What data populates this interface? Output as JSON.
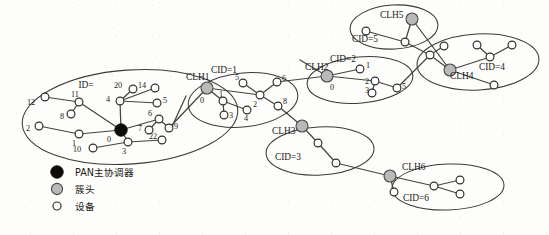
{
  "figure": {
    "type": "network-topology-diagram",
    "background_color": "#fdfdfb",
    "ink_color": "#1b1a18"
  },
  "legend": {
    "items": [
      {
        "marker": "pan-coordinator-marker",
        "label": "PAN主协调器",
        "fill": "#0c0b0a"
      },
      {
        "marker": "cluster-head-marker",
        "label": "簇头",
        "fill": "#b9b9b9"
      },
      {
        "marker": "device-marker",
        "label": "设备",
        "fill": "#ffffff"
      }
    ]
  },
  "clusters": [
    {
      "id": "pan",
      "name": "pan-cluster",
      "cid_label": "",
      "head_label": "",
      "extra_label": "ID=",
      "ellipse": {
        "cx": 130,
        "cy": 117,
        "rx": 108,
        "ry": 47,
        "rot": -4
      },
      "nodes": [
        {
          "id": "0",
          "type": "pan",
          "x": 121,
          "y": 130,
          "r": 6.2,
          "label": "0",
          "lx": 107,
          "ly": 142
        },
        {
          "id": "11",
          "type": "device",
          "x": 79,
          "y": 102,
          "r": 3.9,
          "label": "11",
          "lx": 71,
          "ly": 97
        },
        {
          "id": "12",
          "type": "device",
          "x": 45,
          "y": 97,
          "r": 3.9,
          "label": "12",
          "lx": 27,
          "ly": 105
        },
        {
          "id": "8",
          "type": "device",
          "x": 71,
          "y": 114,
          "r": 3.9,
          "label": "8",
          "lx": 60,
          "ly": 119
        },
        {
          "id": "2",
          "type": "device",
          "x": 39,
          "y": 126,
          "r": 3.9,
          "label": "2",
          "lx": 26,
          "ly": 131
        },
        {
          "id": "1",
          "type": "device",
          "x": 79,
          "y": 134,
          "r": 3.9,
          "label": "1",
          "lx": 72,
          "ly": 146
        },
        {
          "id": "10",
          "type": "device",
          "x": 93,
          "y": 148,
          "r": 3.9,
          "label": "10",
          "lx": 73,
          "ly": 152
        },
        {
          "id": "3",
          "type": "device",
          "x": 128,
          "y": 142,
          "r": 3.9,
          "label": "3",
          "lx": 122,
          "ly": 154
        },
        {
          "id": "4",
          "type": "device",
          "x": 120,
          "y": 101,
          "r": 3.9,
          "label": "4",
          "lx": 106,
          "ly": 102
        },
        {
          "id": "20",
          "type": "device",
          "x": 133,
          "y": 89,
          "r": 3.9,
          "label": "20",
          "lx": 114,
          "ly": 88
        },
        {
          "id": "14",
          "type": "device",
          "x": 155,
          "y": 88,
          "r": 3.9,
          "label": "14",
          "lx": 138,
          "ly": 88
        },
        {
          "id": "5",
          "type": "device",
          "x": 157,
          "y": 103,
          "r": 3.9,
          "label": "5",
          "lx": 163,
          "ly": 103
        },
        {
          "id": "6",
          "type": "device",
          "x": 159,
          "y": 119,
          "r": 3.9,
          "label": "6",
          "lx": 148,
          "ly": 116
        },
        {
          "id": "7",
          "type": "device",
          "x": 149,
          "y": 130,
          "r": 3.9,
          "label": "7",
          "lx": 138,
          "ly": 131
        },
        {
          "id": "9",
          "type": "device",
          "x": 169,
          "y": 128,
          "r": 3.9,
          "label": "9",
          "lx": 174,
          "ly": 129
        },
        {
          "id": "22",
          "type": "device",
          "x": 162,
          "y": 140,
          "r": 3.9,
          "label": "22",
          "lx": 149,
          "ly": 139
        }
      ],
      "links": [
        [
          "0",
          "11"
        ],
        [
          "11",
          "12"
        ],
        [
          "11",
          "8"
        ],
        [
          "0",
          "1"
        ],
        [
          "1",
          "2"
        ],
        [
          "0",
          "3"
        ],
        [
          "3",
          "10"
        ],
        [
          "3",
          "22"
        ],
        [
          "0",
          "4"
        ],
        [
          "4",
          "20"
        ],
        [
          "4",
          "14"
        ],
        [
          "4",
          "5"
        ],
        [
          "0",
          "6"
        ],
        [
          "6",
          "7"
        ],
        [
          "6",
          "9"
        ]
      ]
    },
    {
      "id": "clh1",
      "name": "cluster-1",
      "cid_label": "CID=1",
      "head_label": "CLH1",
      "cid_pos": {
        "x": 224,
        "y": 73
      },
      "head_pos": {
        "x": 186,
        "y": 80
      },
      "ellipse": {
        "cx": 243,
        "cy": 100,
        "rx": 55,
        "ry": 27,
        "rot": -6
      },
      "nodes": [
        {
          "id": "0",
          "type": "clh",
          "x": 207,
          "y": 88,
          "r": 6.0,
          "label": "0",
          "lx": 200,
          "ly": 103
        },
        {
          "id": "1",
          "type": "device",
          "x": 223,
          "y": 101,
          "r": 3.9,
          "label": "1",
          "lx": 219,
          "ly": 97
        },
        {
          "id": "3",
          "type": "device",
          "x": 224,
          "y": 115,
          "r": 3.9,
          "label": "3",
          "lx": 229,
          "ly": 118
        },
        {
          "id": "4",
          "type": "device",
          "x": 247,
          "y": 110,
          "r": 3.9,
          "label": "4",
          "lx": 244,
          "ly": 121
        },
        {
          "id": "2",
          "type": "device",
          "x": 260,
          "y": 95,
          "r": 3.9,
          "label": "2",
          "lx": 253,
          "ly": 107
        },
        {
          "id": "5",
          "type": "device",
          "x": 243,
          "y": 83,
          "r": 3.9,
          "label": "5",
          "lx": 235,
          "ly": 80
        },
        {
          "id": "6",
          "type": "device",
          "x": 277,
          "y": 82,
          "r": 3.9,
          "label": "6",
          "lx": 282,
          "ly": 81
        },
        {
          "id": "8",
          "type": "device",
          "x": 278,
          "y": 106,
          "r": 3.9,
          "label": "8",
          "lx": 283,
          "ly": 104
        }
      ],
      "links": [
        [
          "0",
          "1"
        ],
        [
          "1",
          "3"
        ],
        [
          "1",
          "4"
        ],
        [
          "0",
          "2"
        ],
        [
          "2",
          "5"
        ],
        [
          "2",
          "6"
        ],
        [
          "2",
          "8"
        ]
      ]
    },
    {
      "id": "clh2",
      "name": "cluster-2",
      "cid_label": "CID=2",
      "head_label": "CLH2",
      "cid_pos": {
        "x": 343,
        "y": 62
      },
      "head_pos": {
        "x": 305,
        "y": 70
      },
      "ellipse": {
        "cx": 360,
        "cy": 80,
        "rx": 53,
        "ry": 23,
        "rot": -5
      },
      "nodes": [
        {
          "id": "0",
          "type": "clh",
          "x": 327,
          "y": 76,
          "r": 6.0,
          "label": "0",
          "lx": 330,
          "ly": 90
        },
        {
          "id": "1",
          "type": "device",
          "x": 360,
          "y": 69,
          "r": 3.9,
          "label": "1",
          "lx": 366,
          "ly": 68
        },
        {
          "id": "2",
          "type": "device",
          "x": 375,
          "y": 81,
          "r": 3.9,
          "label": "2",
          "lx": 365,
          "ly": 84
        },
        {
          "id": "3",
          "type": "device",
          "x": 372,
          "y": 93,
          "r": 3.9,
          "label": "3",
          "lx": 365,
          "ly": 93
        },
        {
          "id": "5",
          "type": "device",
          "x": 397,
          "y": 88,
          "r": 3.9,
          "label": "5",
          "lx": 402,
          "ly": 89
        }
      ],
      "links": [
        [
          "0",
          "1"
        ],
        [
          "0",
          "2"
        ],
        [
          "2",
          "3"
        ],
        [
          "2",
          "5"
        ]
      ]
    },
    {
      "id": "clh3",
      "name": "cluster-3",
      "cid_label": "CID=3",
      "head_label": "CLH3",
      "cid_pos": {
        "x": 288,
        "y": 160
      },
      "head_pos": {
        "x": 272,
        "y": 134
      },
      "ellipse": {
        "cx": 320,
        "cy": 151,
        "rx": 54,
        "ry": 24,
        "rot": -3
      },
      "nodes": [
        {
          "id": "h",
          "type": "clh",
          "x": 302,
          "y": 126,
          "r": 6.0,
          "label": "",
          "lx": 0,
          "ly": 0
        },
        {
          "id": "a",
          "type": "device",
          "x": 318,
          "y": 143,
          "r": 3.9,
          "label": "",
          "lx": 0,
          "ly": 0
        },
        {
          "id": "b",
          "type": "device",
          "x": 336,
          "y": 163,
          "r": 3.9,
          "label": "",
          "lx": 0,
          "ly": 0
        }
      ],
      "links": [
        [
          "h",
          "a"
        ],
        [
          "a",
          "b"
        ]
      ]
    },
    {
      "id": "clh4",
      "name": "cluster-4",
      "cid_label": "CID=4",
      "head_label": "CLH4",
      "cid_pos": {
        "x": 492,
        "y": 70
      },
      "head_pos": {
        "x": 450,
        "y": 79
      },
      "ellipse": {
        "cx": 478,
        "cy": 62,
        "rx": 61,
        "ry": 28,
        "rot": -3
      },
      "nodes": [
        {
          "id": "h",
          "type": "clh",
          "x": 450,
          "y": 70,
          "r": 6.0,
          "label": "",
          "lx": 0,
          "ly": 0
        },
        {
          "id": "a",
          "type": "device",
          "x": 430,
          "y": 55,
          "r": 3.9,
          "label": "",
          "lx": 0,
          "ly": 0
        },
        {
          "id": "b",
          "type": "device",
          "x": 444,
          "y": 46,
          "r": 3.9,
          "label": "",
          "lx": 0,
          "ly": 0
        },
        {
          "id": "c",
          "type": "device",
          "x": 490,
          "y": 57,
          "r": 3.9,
          "label": "",
          "lx": 0,
          "ly": 0
        },
        {
          "id": "d",
          "type": "device",
          "x": 477,
          "y": 45,
          "r": 3.9,
          "label": "",
          "lx": 0,
          "ly": 0
        },
        {
          "id": "e",
          "type": "device",
          "x": 512,
          "y": 45,
          "r": 3.9,
          "label": "",
          "lx": 0,
          "ly": 0
        },
        {
          "id": "f",
          "type": "device",
          "x": 494,
          "y": 85,
          "r": 3.9,
          "label": "",
          "lx": 0,
          "ly": 0
        }
      ],
      "links": [
        [
          "h",
          "a"
        ],
        [
          "a",
          "b"
        ],
        [
          "h",
          "c"
        ],
        [
          "c",
          "d"
        ],
        [
          "c",
          "e"
        ],
        [
          "h",
          "f"
        ]
      ]
    },
    {
      "id": "clh5",
      "name": "cluster-5",
      "cid_label": "CID=5",
      "head_label": "CLH5",
      "cid_pos": {
        "x": 365,
        "y": 42
      },
      "head_pos": {
        "x": 380,
        "y": 18
      },
      "ellipse": {
        "cx": 394,
        "cy": 27,
        "rx": 44,
        "ry": 22,
        "rot": -3
      },
      "nodes": [
        {
          "id": "h",
          "type": "clh",
          "x": 412,
          "y": 19,
          "r": 6.0,
          "label": "",
          "lx": 0,
          "ly": 0
        },
        {
          "id": "a",
          "type": "device",
          "x": 366,
          "y": 31,
          "r": 3.9,
          "label": "",
          "lx": 0,
          "ly": 0
        },
        {
          "id": "b",
          "type": "device",
          "x": 405,
          "y": 42,
          "r": 3.9,
          "label": "",
          "lx": 0,
          "ly": 0
        }
      ],
      "links": [
        [
          "h",
          "b"
        ],
        [
          "b",
          "a"
        ]
      ]
    },
    {
      "id": "clh6",
      "name": "cluster-6",
      "cid_label": "CID=6",
      "head_label": "CLH6",
      "cid_pos": {
        "x": 416,
        "y": 201
      },
      "head_pos": {
        "x": 402,
        "y": 170
      },
      "ellipse": {
        "cx": 448,
        "cy": 187,
        "rx": 56,
        "ry": 23,
        "rot": -2
      },
      "nodes": [
        {
          "id": "h",
          "type": "clh",
          "x": 390,
          "y": 176,
          "r": 6.0,
          "label": "",
          "lx": 0,
          "ly": 0
        },
        {
          "id": "a",
          "type": "device",
          "x": 394,
          "y": 192,
          "r": 3.9,
          "label": "",
          "lx": 0,
          "ly": 0
        },
        {
          "id": "b",
          "type": "device",
          "x": 434,
          "y": 186,
          "r": 3.9,
          "label": "",
          "lx": 0,
          "ly": 0
        },
        {
          "id": "c",
          "type": "device",
          "x": 460,
          "y": 180,
          "r": 3.9,
          "label": "",
          "lx": 0,
          "ly": 0
        },
        {
          "id": "d",
          "type": "device",
          "x": 460,
          "y": 194,
          "r": 3.9,
          "label": "",
          "lx": 0,
          "ly": 0
        }
      ],
      "links": [
        [
          "h",
          "a"
        ],
        [
          "h",
          "b"
        ],
        [
          "b",
          "c"
        ],
        [
          "b",
          "d"
        ]
      ]
    }
  ],
  "inter_cluster_links": [
    {
      "from": "pan-0-area",
      "x1": 169,
      "y1": 128,
      "x2": 207,
      "y2": 88
    },
    {
      "from": "clh1-head",
      "x1": 186,
      "y1": 96,
      "x2": 170,
      "y2": 131
    },
    {
      "from": "clh1-6",
      "x1": 277,
      "y1": 82,
      "x2": 327,
      "y2": 76
    },
    {
      "from": "clh1-8",
      "x1": 278,
      "y1": 106,
      "x2": 302,
      "y2": 126
    },
    {
      "from": "clh2-head",
      "x1": 327,
      "y1": 76,
      "x2": 300,
      "y2": 60
    },
    {
      "from": "clh5-head",
      "x1": 412,
      "y1": 19,
      "x2": 450,
      "y2": 70
    },
    {
      "from": "clh2-5",
      "x1": 397,
      "y1": 88,
      "x2": 430,
      "y2": 55
    },
    {
      "from": "clh3-b",
      "x1": 336,
      "y1": 163,
      "x2": 390,
      "y2": 176
    },
    {
      "from": "clh4-left",
      "x1": 430,
      "y1": 55,
      "x2": 405,
      "y2": 42
    }
  ]
}
